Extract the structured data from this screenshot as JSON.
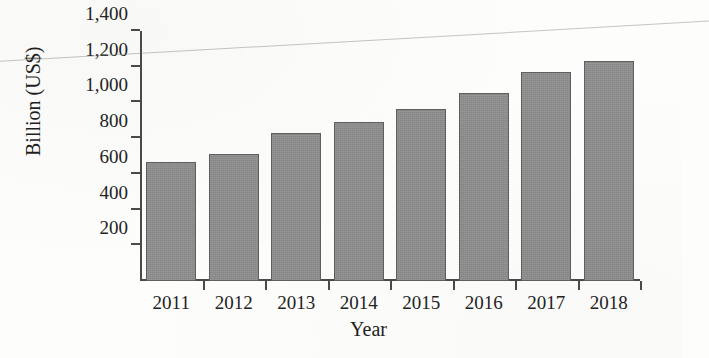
{
  "chart_data": {
    "type": "bar",
    "title": "",
    "subtitle": "",
    "xlabel": "Year",
    "ylabel": "Billion (US$)",
    "categories": [
      "2011",
      "2012",
      "2013",
      "2014",
      "2015",
      "2016",
      "2017",
      "2018"
    ],
    "values": [
      665,
      712,
      828,
      890,
      962,
      1052,
      1172,
      1232
    ],
    "series": [
      {
        "name": "",
        "values": [
          665,
          712,
          828,
          890,
          962,
          1052,
          1172,
          1232
        ]
      }
    ],
    "ylim": [
      0,
      1400
    ],
    "y_ticks": [
      200,
      400,
      600,
      800,
      1000,
      1200,
      1400
    ],
    "y_tick_labels": [
      "200",
      "400",
      "600",
      "800",
      "1,000",
      "1,200",
      "1,400"
    ],
    "x_tick_labels": [
      "2011",
      "2012",
      "2013",
      "2014",
      "2015",
      "2016",
      "2017",
      "2018"
    ],
    "grid": false,
    "legend": false,
    "legend_position": "none",
    "bar_color": "#8d8d8d",
    "bar_edge_color": "#5f5f5f",
    "axis_color": "#4a4a4a",
    "background_color": "#fdfdfb",
    "annotations": []
  },
  "artifacts": {
    "scan_line_name": "diagonal-scan-line"
  }
}
